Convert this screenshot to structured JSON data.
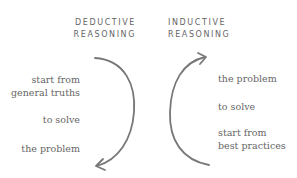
{
  "deductive": {
    "title_line1": "DEDUCTIVE",
    "title_line2": "REASONING",
    "steps": [
      {
        "line1": "start from",
        "line2": "general truths"
      },
      {
        "line1": "to solve"
      },
      {
        "line1": "the problem"
      }
    ],
    "arrow_direction": "top-to-bottom"
  },
  "inductive": {
    "title_line1": "INDUCTIVE",
    "title_line2": "REASONING",
    "steps": [
      {
        "line1": "the problem"
      },
      {
        "line1": "to solve"
      },
      {
        "line1": "start from",
        "line2": "best practices"
      }
    ],
    "arrow_direction": "bottom-to-top"
  },
  "colors": {
    "text": "#666666",
    "arrow": "#777777",
    "background": "#ffffff"
  }
}
